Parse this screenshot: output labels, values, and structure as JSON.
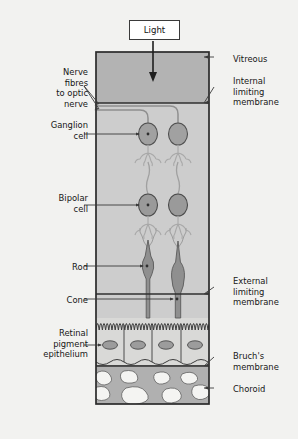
{
  "figure": {
    "light_label": "Light"
  },
  "labels_left": [
    {
      "name": "nerve-fibres-to-optic-nerve",
      "text": "Nerve\nfibres\nto optic\nnerve",
      "x": 10,
      "y": 67,
      "w": 78,
      "align": "right"
    },
    {
      "name": "ganglion-cell",
      "text": "Ganglion\ncell",
      "x": 10,
      "y": 120,
      "w": 78,
      "align": "right"
    },
    {
      "name": "bipolar-cell",
      "text": "Bipolar\ncell",
      "x": 10,
      "y": 193,
      "w": 78,
      "align": "right"
    },
    {
      "name": "rod",
      "text": "Rod",
      "x": 10,
      "y": 262,
      "w": 78,
      "align": "right"
    },
    {
      "name": "cone",
      "text": "Cone",
      "x": 10,
      "y": 295,
      "w": 78,
      "align": "right"
    },
    {
      "name": "retinal-pigment-epithelium",
      "text": "Retinal\npigment\nepithelium",
      "x": 4,
      "y": 328,
      "w": 84,
      "align": "right"
    }
  ],
  "labels_right": [
    {
      "name": "vitreous",
      "text": "Vitreous",
      "x": 233,
      "y": 54,
      "w": 62,
      "align": "left"
    },
    {
      "name": "internal-limiting-membrane",
      "text": "Internal\nlimiting\nmembrane",
      "x": 233,
      "y": 76,
      "w": 62,
      "align": "left"
    },
    {
      "name": "external-limiting-membrane",
      "text": "External\nlimiting\nmembrane",
      "x": 233,
      "y": 276,
      "w": 62,
      "align": "left"
    },
    {
      "name": "bruchs-membrane",
      "text": "Bruch's\nmembrane",
      "x": 233,
      "y": 351,
      "w": 62,
      "align": "left"
    },
    {
      "name": "choroid",
      "text": "Choroid",
      "x": 233,
      "y": 384,
      "w": 62,
      "align": "left"
    }
  ],
  "colors": {
    "background": "#f2f2f0",
    "outline": "#2b2b2b",
    "vitreous_fill": "#b3b3b3",
    "retina_fill": "#cfcfcf",
    "ganglion_fill": "#9e9e9e",
    "bipolar_fill": "#9a9a9a",
    "photoreceptor_fill": "#8f8f8f",
    "rpe_fill": "#d6d6d6",
    "rpe_nucleus": "#9c9c9c",
    "choroid_fill": "#b0b0b0",
    "vessel_fill": "#f4f4f2",
    "leader_line": "#3a3a3a",
    "fibre_line": "#8c8c8c",
    "light_box_bg": "#ffffff",
    "text": "#161616"
  },
  "geometry": {
    "box_left": 96,
    "box_right": 209,
    "box_top": 52,
    "box_bottom": 404,
    "internal_limiting_membrane_y": 103,
    "external_limiting_membrane_y": 294,
    "bruchs_membrane_y": 366,
    "rpe_top_y": 320,
    "cell_x_rod": 148,
    "cell_x_cone": 178
  },
  "structures": [
    {
      "name": "light-arrow",
      "type": "arrow"
    },
    {
      "name": "vitreous-layer",
      "type": "band"
    },
    {
      "name": "nerve-fibre-layer",
      "type": "band"
    },
    {
      "name": "ganglion-cell-layer",
      "type": "cells",
      "count": 2
    },
    {
      "name": "bipolar-cell-layer",
      "type": "cells",
      "count": 2
    },
    {
      "name": "photoreceptor-layer",
      "type": "cells",
      "count": 2
    },
    {
      "name": "retinal-pigment-epithelium-layer",
      "type": "cells",
      "count": 4
    },
    {
      "name": "choroid-layer",
      "type": "band"
    }
  ]
}
